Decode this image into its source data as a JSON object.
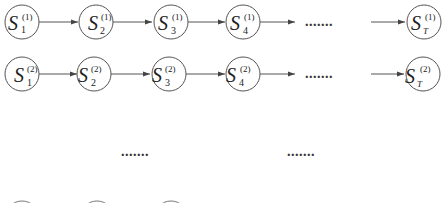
{
  "diagram": {
    "type": "state-chain-diagram",
    "colors": {
      "stroke": "#555555",
      "text": "#222222",
      "background": "#ffffff"
    },
    "rows": [
      {
        "id": "row-1",
        "superscript": "(1)",
        "nodes": [
          {
            "symbol": "S",
            "subscript": "1",
            "superscript": "(1)"
          },
          {
            "symbol": "S",
            "subscript": "2",
            "superscript": "(1)"
          },
          {
            "symbol": "S",
            "subscript": "3",
            "superscript": "(1)"
          },
          {
            "symbol": "S",
            "subscript": "4",
            "superscript": "(1)"
          },
          {
            "symbol": "S",
            "subscript": "T",
            "superscript": "(1)"
          }
        ],
        "ellipsis": "......."
      },
      {
        "id": "row-2",
        "superscript": "(2)",
        "nodes": [
          {
            "symbol": "S",
            "subscript": "1",
            "superscript": "(2)"
          },
          {
            "symbol": "S",
            "subscript": "2",
            "superscript": "(2)"
          },
          {
            "symbol": "S",
            "subscript": "3",
            "superscript": "(2)"
          },
          {
            "symbol": "S",
            "subscript": "4",
            "superscript": "(2)"
          },
          {
            "symbol": "S",
            "subscript": "T",
            "superscript": "(2)"
          }
        ],
        "ellipsis": "......."
      }
    ],
    "vertical_ellipsis": [
      ".......",
      " ......."
    ]
  }
}
